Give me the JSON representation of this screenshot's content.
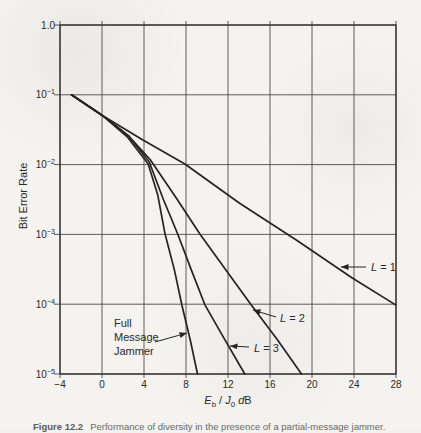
{
  "chart_data": {
    "type": "line",
    "title": "",
    "ylabel": "Bit Error Rate",
    "xlabel_segments": [
      [
        "E",
        "i"
      ],
      [
        "b",
        "sub"
      ],
      [
        " / ",
        ""
      ],
      [
        "J",
        "i"
      ],
      [
        "0",
        "sub"
      ],
      [
        " ",
        ""
      ],
      [
        "d",
        "i"
      ],
      [
        "B",
        ""
      ]
    ],
    "x_axis_type": "linear",
    "y_axis_type": "log",
    "xlim": [
      -4,
      28
    ],
    "ylim": [
      1e-05,
      1.0
    ],
    "grid": true,
    "x_ticks": [
      -4,
      0,
      4,
      8,
      12,
      16,
      20,
      24,
      28
    ],
    "y_ticks": [
      {
        "label": "1.0",
        "log": 0
      },
      {
        "base": "10",
        "exp": "−1",
        "log": -1
      },
      {
        "base": "10",
        "exp": "−2",
        "log": -2
      },
      {
        "base": "10",
        "exp": "−3",
        "log": -3
      },
      {
        "base": "10",
        "exp": "−4",
        "log": -4
      },
      {
        "base": "10",
        "exp": "−5",
        "log": -5
      }
    ],
    "series": [
      {
        "name": "L = 1",
        "points": [
          [
            -2.9,
            0.1
          ],
          [
            0,
            0.051
          ],
          [
            3.9,
            0.0225
          ],
          [
            7.9,
            0.0102
          ],
          [
            13.1,
            0.0028
          ],
          [
            18.5,
            0.00083
          ],
          [
            23.8,
            0.00024
          ],
          [
            28,
            9.7e-05
          ]
        ]
      },
      {
        "name": "L = 2",
        "points": [
          [
            -2.9,
            0.1
          ],
          [
            0,
            0.051
          ],
          [
            2.5,
            0.026
          ],
          [
            4.6,
            0.0117
          ],
          [
            7.2,
            0.0031
          ],
          [
            9.3,
            0.00102
          ],
          [
            11.8,
            0.00031
          ],
          [
            14.2,
            9.8e-05
          ],
          [
            16.7,
            3.1e-05
          ],
          [
            19.0,
            1e-05
          ]
        ]
      },
      {
        "name": "L = 3",
        "points": [
          [
            -2.9,
            0.1
          ],
          [
            0,
            0.051
          ],
          [
            2.5,
            0.026
          ],
          [
            4.5,
            0.0109
          ],
          [
            5.8,
            0.0033
          ],
          [
            7.2,
            0.00102
          ],
          [
            8.5,
            0.00031
          ],
          [
            9.8,
            9.8e-05
          ],
          [
            11.7,
            3.1e-05
          ],
          [
            13.6,
            1e-05
          ]
        ]
      },
      {
        "name": "Full Message Jammer",
        "points": [
          [
            -2.9,
            0.1
          ],
          [
            0,
            0.051
          ],
          [
            2.4,
            0.025
          ],
          [
            4.4,
            0.0102
          ],
          [
            5.3,
            0.0037
          ],
          [
            6.0,
            0.00102
          ],
          [
            6.9,
            0.00031
          ],
          [
            7.6,
            9.8e-05
          ],
          [
            8.4,
            3.1e-05
          ],
          [
            9.1,
            1e-05
          ]
        ]
      }
    ],
    "annotations": [
      {
        "id": "label-L1",
        "segments": [
          [
            "L",
            "i"
          ],
          [
            " = 1",
            ""
          ]
        ],
        "text_xy": [
          371,
          271
        ],
        "arrow": [
          [
            366,
            267
          ],
          [
            341,
            267
          ]
        ]
      },
      {
        "id": "label-L2",
        "segments": [
          [
            "L",
            "i"
          ],
          [
            " = 2",
            ""
          ]
        ],
        "text_xy": [
          280,
          322
        ],
        "arrow": [
          [
            276,
            317
          ],
          [
            253,
            310
          ]
        ]
      },
      {
        "id": "label-L3",
        "segments": [
          [
            "L",
            "i"
          ],
          [
            " = 3",
            ""
          ]
        ],
        "text_xy": [
          254,
          352
        ],
        "arrow": [
          [
            249,
            347
          ],
          [
            230,
            346
          ]
        ]
      },
      {
        "id": "label-full-message-jammer",
        "lines": [
          "Full",
          "Message",
          "Jammer"
        ],
        "text_xy": [
          114,
          327
        ],
        "line_height": 14,
        "arrow": [
          [
            155,
            342
          ],
          [
            187,
            333
          ]
        ]
      }
    ],
    "colors": {
      "curve": "#262422",
      "grid": "#4e4b47",
      "frame": "#343230",
      "text": "#2c2a28"
    },
    "legend_position": "none"
  },
  "caption": {
    "lead": "Figure 12.2",
    "text": "Performance of diversity in the presence of a partial-message jammer."
  }
}
